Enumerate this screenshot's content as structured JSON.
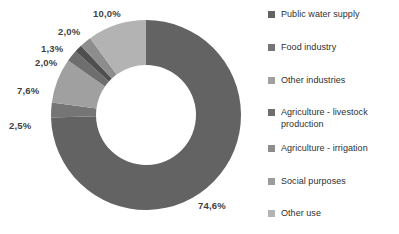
{
  "chart_data": {
    "type": "pie",
    "variant": "donut",
    "title": "",
    "subtitle": "",
    "xlabel": "",
    "ylabel": "",
    "legend_position": "right",
    "grid": false,
    "decimal_separator": ",",
    "value_unit": "%",
    "categories": [
      "Public water supply",
      "Food industry",
      "Other industries",
      "Agriculture - livestock production",
      "Agriculture - irrigation",
      "Social purposes",
      "Other use"
    ],
    "values": [
      74.6,
      2.5,
      7.6,
      2.0,
      1.3,
      2.0,
      10.0
    ],
    "labels": [
      "74,6%",
      "2,5%",
      "7,6%",
      "2,0%",
      "1,3%",
      "2,0%",
      "10,0%"
    ],
    "colors": [
      "#636363",
      "#757575",
      "#a0a0a0",
      "#6e6e6e",
      "#4f4f4f",
      "#8d8d8d",
      "#b3b3b3"
    ]
  },
  "slice_labels": [
    {
      "text": "10,0%",
      "x": 93,
      "y": 8
    },
    {
      "text": "2,0%",
      "x": 58,
      "y": 26
    },
    {
      "text": "1,3%",
      "x": 41,
      "y": 43
    },
    {
      "text": "2,0%",
      "x": 35,
      "y": 57
    },
    {
      "text": "7,6%",
      "x": 17,
      "y": 85
    },
    {
      "text": "2,5%",
      "x": 9,
      "y": 120
    },
    {
      "text": "74,6%",
      "x": 198,
      "y": 200
    }
  ],
  "legend": {
    "items": [
      {
        "label": "Public water supply",
        "color": "#636363",
        "top": 9
      },
      {
        "label": "Food industry",
        "color": "#757575",
        "top": 42
      },
      {
        "label": "Other industries",
        "color": "#a0a0a0",
        "top": 75
      },
      {
        "label": "Agriculture - livestock production",
        "color": "#6e6e6e",
        "top": 107
      },
      {
        "label": "Agriculture - irrigation",
        "color": "#8d8d8d",
        "top": 143
      },
      {
        "label": "Social purposes",
        "color": "#9c9c9c",
        "top": 176
      },
      {
        "label": "Other use",
        "color": "#b3b3b3",
        "top": 208
      }
    ]
  }
}
